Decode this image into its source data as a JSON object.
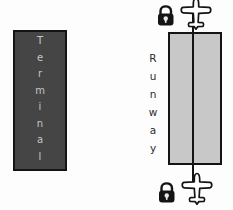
{
  "diagram": {
    "terminal": {
      "label": "Terminal",
      "fill_color": "#454545",
      "text_color": "#c6c6c6"
    },
    "runway": {
      "label": "Runway",
      "fill_color": "#c8c8c8",
      "text_color": "#2b2b2b"
    },
    "flight_path": {
      "color": "#141414",
      "endpoints": [
        "airplane-icon-top",
        "airplane-icon-bottom"
      ]
    },
    "icons": [
      "lock-icon-top",
      "airplane-icon-top",
      "lock-icon-bottom",
      "airplane-icon-bottom"
    ],
    "outline_color": "#141414",
    "background_color": "#fdfdfd"
  }
}
